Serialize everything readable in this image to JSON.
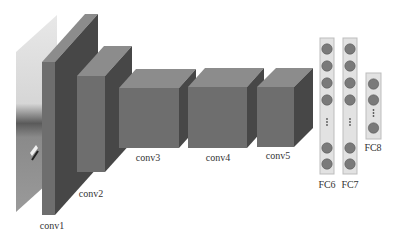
{
  "diagram": {
    "colors": {
      "front": "#6e6e6e",
      "top": "#8c8c8c",
      "side": "#474747",
      "fc_bar": "#e2e2e2",
      "fc_bar_border": "#bdbdbd",
      "neuron": "#7a7a7a",
      "neuron_border": "#5a5a5a",
      "label": "#333333"
    },
    "input_image": {
      "label": "input-image",
      "points": "16,52 57,15 57,175 16,212"
    },
    "layers": [
      {
        "id": "conv1",
        "label": "conv1",
        "front": {
          "x": 42,
          "y": 62,
          "w": 13,
          "h": 153
        },
        "depth": {
          "dx": 43,
          "dy": -48
        },
        "label_pos": {
          "x": 52,
          "y": 229
        }
      },
      {
        "id": "conv2",
        "label": "conv2",
        "front": {
          "x": 77,
          "y": 76,
          "w": 28,
          "h": 96
        },
        "depth": {
          "dx": 27,
          "dy": -30
        },
        "label_pos": {
          "x": 91,
          "y": 197
        }
      },
      {
        "id": "conv3",
        "label": "conv3",
        "front": {
          "x": 119,
          "y": 88,
          "w": 60,
          "h": 60
        },
        "depth": {
          "dx": 17,
          "dy": -19
        },
        "label_pos": {
          "x": 148,
          "y": 161
        }
      },
      {
        "id": "conv4",
        "label": "conv4",
        "front": {
          "x": 188,
          "y": 87,
          "w": 59,
          "h": 61
        },
        "depth": {
          "dx": 17,
          "dy": -19
        },
        "label_pos": {
          "x": 218,
          "y": 161
        }
      },
      {
        "id": "conv5",
        "label": "conv5",
        "front": {
          "x": 257,
          "y": 87,
          "w": 37,
          "h": 60
        },
        "depth": {
          "dx": 19,
          "dy": -19
        },
        "label_pos": {
          "x": 278,
          "y": 159
        }
      }
    ],
    "fc_layers": [
      {
        "id": "fc6",
        "label": "FC6",
        "bar": {
          "x": 320,
          "y": 38,
          "w": 14,
          "h": 136
        },
        "neurons_y": [
          49,
          66,
          83,
          100,
          148,
          164
        ],
        "dots_y": 122,
        "label_pos": {
          "x": 327,
          "y": 188
        }
      },
      {
        "id": "fc7",
        "label": "FC7",
        "bar": {
          "x": 343,
          "y": 38,
          "w": 14,
          "h": 136
        },
        "neurons_y": [
          49,
          66,
          83,
          100,
          148,
          164
        ],
        "dots_y": 122,
        "label_pos": {
          "x": 350,
          "y": 188
        }
      },
      {
        "id": "fc8",
        "label": "FC8",
        "bar": {
          "x": 366,
          "y": 73,
          "w": 15,
          "h": 66
        },
        "neurons_y": [
          84,
          100,
          128
        ],
        "dots_y": 113,
        "label_pos": {
          "x": 373,
          "y": 151
        }
      }
    ]
  }
}
